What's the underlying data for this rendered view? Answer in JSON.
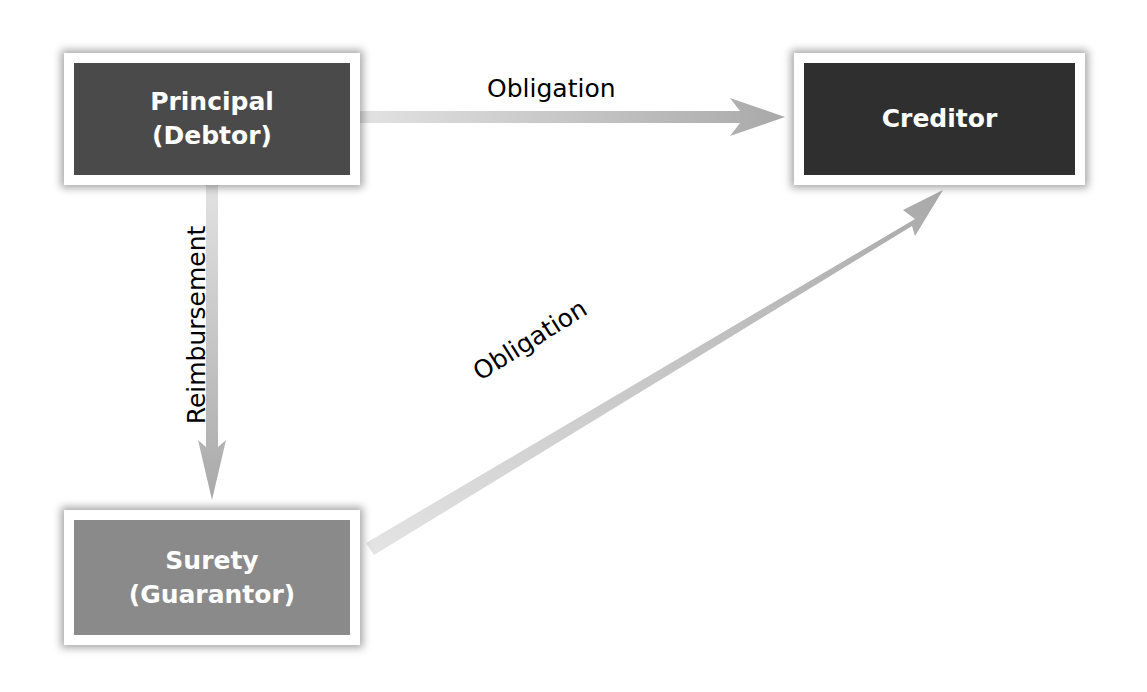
{
  "nodes": {
    "principal": {
      "line1": "Principal",
      "line2": "(Debtor)",
      "fill": "#4a4a4a"
    },
    "creditor": {
      "line1": "Creditor",
      "fill": "#2f2f2f"
    },
    "surety": {
      "line1": "Surety",
      "line2": "(Guarantor)",
      "fill": "#8a8a8a"
    }
  },
  "edges": [
    {
      "from": "principal",
      "to": "creditor",
      "label": "Obligation"
    },
    {
      "from": "principal",
      "to": "surety",
      "label": "Reimbursement"
    },
    {
      "from": "surety",
      "to": "creditor",
      "label": "Obligation"
    }
  ],
  "colors": {
    "arrow": "#b5b5b5",
    "background": "#ffffff",
    "text": "#ffffff"
  }
}
